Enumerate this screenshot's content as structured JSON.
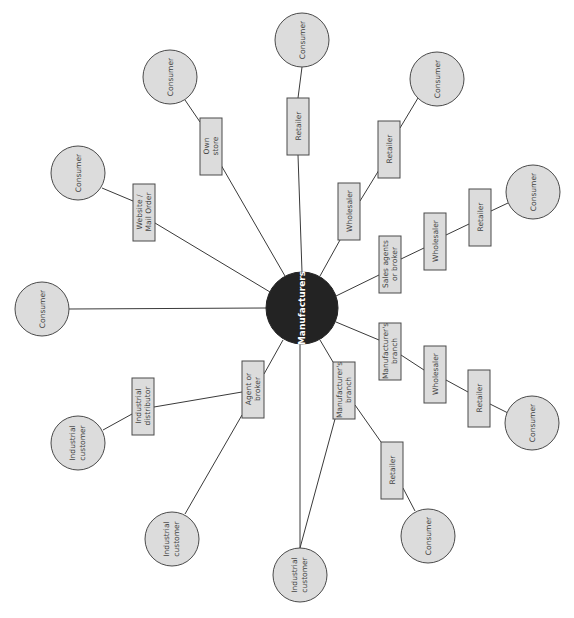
{
  "diagram": {
    "type": "radial distribution-channel map",
    "orientation": "rotated -90deg (text reads bottom-to-top)",
    "colors": {
      "center_fill": "#232323",
      "center_text": "#ffffff",
      "node_fill": "#dcdcdc",
      "node_stroke": "#4a4a4a",
      "edge": "#3a3a3a",
      "label_text": "#444444"
    },
    "center": {
      "label": "Manufacturers"
    },
    "nodes": {
      "c_top": {
        "label": "Consumer"
      },
      "b_top_retailer": {
        "label": "Retailer"
      },
      "c_ownstore": {
        "label": "Consumer"
      },
      "b_ownstore": {
        "label1": "Own",
        "label2": "store"
      },
      "c_web": {
        "label": "Consumer"
      },
      "b_web": {
        "label1": "Website /",
        "label2": "Mail Order"
      },
      "c_direct": {
        "label": "Consumer"
      },
      "b_w1_wholesaler": {
        "label": "Wholesaler"
      },
      "b_w1_retailer": {
        "label": "Retailer"
      },
      "c_w1": {
        "label": "Consumer"
      },
      "b_sa": {
        "label1": "Sales agents",
        "label2": "or broker"
      },
      "b_sa_wholesaler": {
        "label": "Wholesaler"
      },
      "b_sa_retailer": {
        "label": "Retailer"
      },
      "c_sa": {
        "label": "Consumer"
      },
      "b_mb1": {
        "label1": "Manufacturer's",
        "label2": "branch"
      },
      "b_mb1_wholesaler": {
        "label": "Wholesaler"
      },
      "b_mb1_retailer": {
        "label": "Retailer"
      },
      "c_mb1": {
        "label": "Consumer"
      },
      "b_mb2": {
        "label1": "Manufacturer's",
        "label2": "branch"
      },
      "b_mb2_retailer": {
        "label": "Retailer"
      },
      "c_mb2": {
        "label": "Consumer"
      },
      "ic_bottom": {
        "label1": "Industrial",
        "label2": "customer"
      },
      "b_agent": {
        "label1": "Agent or",
        "label2": "broker"
      },
      "b_ind_dist": {
        "label1": "Industrial",
        "label2": "distributor"
      },
      "ic_dist": {
        "label1": "Industrial",
        "label2": "customer"
      },
      "ic_agent": {
        "label1": "Industrial",
        "label2": "customer"
      }
    },
    "channels": [
      [
        "Manufacturers",
        "Retailer",
        "Consumer"
      ],
      [
        "Manufacturers",
        "Own store",
        "Consumer"
      ],
      [
        "Manufacturers",
        "Website / Mail Order",
        "Consumer"
      ],
      [
        "Manufacturers",
        "Consumer"
      ],
      [
        "Manufacturers",
        "Wholesaler",
        "Retailer",
        "Consumer"
      ],
      [
        "Manufacturers",
        "Sales agents or broker",
        "Wholesaler",
        "Retailer",
        "Consumer"
      ],
      [
        "Manufacturers",
        "Manufacturer's branch",
        "Wholesaler",
        "Retailer",
        "Consumer"
      ],
      [
        "Manufacturers",
        "Manufacturer's branch",
        "Retailer",
        "Consumer"
      ],
      [
        "Manufacturers",
        "Manufacturer's branch",
        "Industrial customer"
      ],
      [
        "Manufacturers",
        "Industrial customer"
      ],
      [
        "Manufacturers",
        "Agent or broker",
        "Industrial distributor",
        "Industrial customer"
      ],
      [
        "Manufacturers",
        "Agent or broker",
        "Industrial customer"
      ]
    ]
  }
}
